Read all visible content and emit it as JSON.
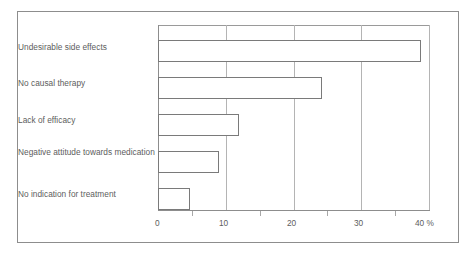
{
  "chart_data": {
    "type": "bar",
    "orientation": "horizontal",
    "title": "",
    "xlabel": "",
    "ylabel": "",
    "unit": "%",
    "categories": [
      "Undesirable side effects",
      "No causal therapy",
      "Lack of efficacy",
      "Negative attitude towards medication",
      "No indication for treatment"
    ],
    "values": [
      38.8,
      24.2,
      11.9,
      9.0,
      4.7
    ],
    "xlim": [
      0,
      40
    ],
    "xticks": [
      0,
      10,
      20,
      30,
      40
    ],
    "xtick_labels": [
      "0",
      "10",
      "20",
      "30",
      "40 %"
    ],
    "minor_xticks": [
      5,
      15,
      25,
      35
    ],
    "grid": true,
    "legend": null,
    "bar_style": {
      "fill": "#ffffff",
      "edge": "#7a7a7a"
    },
    "colors": {
      "frame": "#8d8d8d",
      "gridline": "#b4b4b4",
      "axis": "#8d8d8d",
      "text": "#5d5d5d",
      "background": "#ffffff"
    }
  }
}
